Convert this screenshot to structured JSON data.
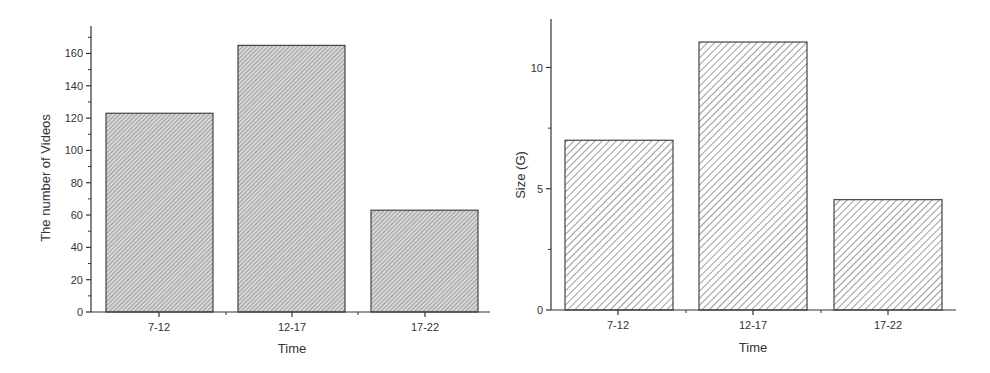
{
  "chart_data": [
    {
      "type": "bar",
      "title": "",
      "xlabel": "Time",
      "ylabel": "The number of Videos",
      "categories": [
        "7-12",
        "12-17",
        "17-22"
      ],
      "values": [
        123,
        165,
        63
      ],
      "ylim": [
        0,
        177
      ],
      "yticks": [
        0,
        20,
        40,
        60,
        80,
        100,
        120,
        140,
        160
      ],
      "ytick_labels": [
        "0",
        "20",
        "40",
        "60",
        "80",
        "100",
        "120",
        "140",
        "160"
      ],
      "grid": false,
      "legend": null,
      "fill": "dense diagonal hatch (gray)"
    },
    {
      "type": "bar",
      "title": "",
      "xlabel": "Time",
      "ylabel": "Size (G)",
      "categories": [
        "7-12",
        "12-17",
        "17-22"
      ],
      "values": [
        7.0,
        11.05,
        4.55
      ],
      "ylim": [
        0,
        12
      ],
      "yticks": [
        0,
        5,
        10
      ],
      "ytick_labels": [
        "0",
        "5",
        "10"
      ],
      "grid": false,
      "legend": null,
      "fill": "open diagonal hatch"
    }
  ],
  "charts": {
    "left": {
      "xlabel": "Time",
      "ylabel": "The number of Videos",
      "categories": [
        "7-12",
        "12-17",
        "17-22"
      ],
      "yticks": [
        "0",
        "20",
        "40",
        "60",
        "80",
        "100",
        "120",
        "140",
        "160"
      ]
    },
    "right": {
      "xlabel": "Time",
      "ylabel": "Size (G)",
      "categories": [
        "7-12",
        "12-17",
        "17-22"
      ],
      "yticks": [
        "0",
        "5",
        "10"
      ]
    }
  },
  "colors": {
    "axis": "#333333",
    "bar_edge": "#333333",
    "hatch_dense": "#666666",
    "hatch_open": "#555555",
    "background": "#ffffff"
  }
}
